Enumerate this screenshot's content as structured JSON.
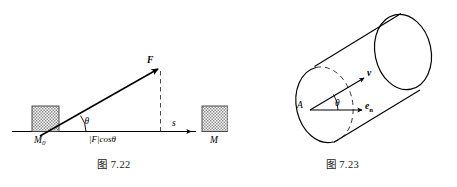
{
  "page": {
    "background_color": "#ffffff",
    "width": 457,
    "height": 187,
    "ink_color": "#000000"
  },
  "figures": [
    {
      "id": "work-of-force",
      "caption": "图 7.22",
      "description": "Block pushed along a horizontal line by an inclined force F through displacement s",
      "labels": {
        "start_block": "M0",
        "start_block_base": "M",
        "start_block_sub": "0",
        "end_block": "M",
        "force": "F",
        "angle": "θ",
        "horizontal_component": "|F|cosθ",
        "displacement": "s"
      },
      "style": {
        "block_fill_pattern": "checker-hatch",
        "block_fill_color": "#9a9a9a",
        "line_color": "#000000",
        "dashed_color": "#333333"
      }
    },
    {
      "id": "cylinder-flux",
      "caption": "图 7.23",
      "description": "Oblique cylinder with point A on the near end face; velocity vector v at angle theta to the outward normal e_n",
      "labels": {
        "point": "A",
        "velocity": "v",
        "normal_base": "e",
        "normal_sub": "n",
        "normal": "en",
        "angle": "θ"
      },
      "style": {
        "line_color": "#000000",
        "dashed_color": "#333333"
      }
    }
  ]
}
